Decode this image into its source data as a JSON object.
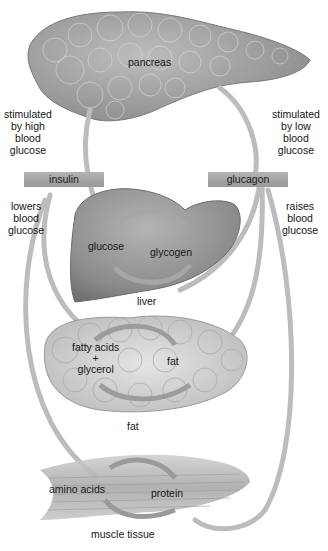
{
  "diagram": {
    "organs": {
      "pancreas": "pancreas",
      "liver": "liver",
      "fat": "fat",
      "muscle": "muscle tissue"
    },
    "left_branch": {
      "stimulus": [
        "stimulated",
        "by high",
        "blood",
        "glucose"
      ],
      "hormone": "insulin",
      "effect": [
        "lowers",
        "blood",
        "glucose"
      ]
    },
    "right_branch": {
      "stimulus": [
        "stimulated",
        "by low",
        "blood",
        "glucose"
      ],
      "hormone": "glucagon",
      "effect": [
        "raises",
        "blood",
        "glucose"
      ]
    },
    "liver_cycle": {
      "a": "glucose",
      "b": "glycogen"
    },
    "fat_cycle": {
      "a_line1": "fatty acids",
      "a_plus": "+",
      "a_line2": "glycerol",
      "b": "fat"
    },
    "muscle_cycle": {
      "a": "amino acids",
      "b": "protein"
    },
    "colors": {
      "organ_gray": "#8f8f8f",
      "arrow_gray": "#b8b8b8",
      "hormone_box": "#a8a8a8"
    }
  }
}
